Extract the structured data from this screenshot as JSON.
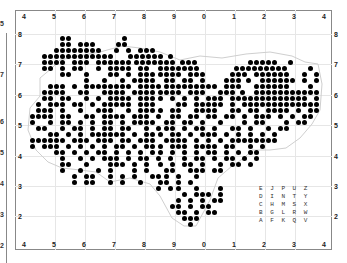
{
  "map": {
    "top_axis_labels": [
      "4",
      "5",
      "6",
      "7",
      "8",
      "9",
      "0",
      "1",
      "2",
      "3",
      "4"
    ],
    "bottom_axis_labels": [
      "4",
      "5",
      "6",
      "7",
      "8",
      "9",
      "0",
      "1",
      "2",
      "3",
      "4"
    ],
    "left_axis_labels": [
      "8",
      "7",
      "6",
      "5",
      "4",
      "3",
      "2"
    ],
    "right_axis_labels": [
      "8",
      "7",
      "6",
      "5",
      "4",
      "3",
      "2"
    ],
    "previous_panel_labels": [
      "5",
      "7",
      "6",
      "5",
      "4",
      "3",
      "2"
    ],
    "dot_color": "#000000",
    "grid_color": "#e6e6e6",
    "tetrad_legend": [
      [
        "E",
        "J",
        "P",
        "U",
        "Z"
      ],
      [
        "D",
        "I",
        "N",
        "T",
        "Y"
      ],
      [
        "C",
        "H",
        "M",
        "S",
        "X"
      ],
      [
        "B",
        "G",
        "L",
        "R",
        "W"
      ],
      [
        "A",
        "F",
        "K",
        "Q",
        "V"
      ]
    ],
    "dot_rows": [
      {
        "y": 38,
        "xs": [
          62,
          68,
          124
        ]
      },
      {
        "y": 44,
        "xs": [
          62,
          68,
          80,
          86,
          92,
          118,
          124
        ]
      },
      {
        "y": 50,
        "xs": [
          56,
          62,
          68,
          74,
          80,
          86,
          92,
          98,
          116,
          128,
          140,
          146,
          152
        ]
      },
      {
        "y": 56,
        "xs": [
          44,
          50,
          56,
          62,
          68,
          74,
          80,
          86,
          92,
          98,
          104,
          110,
          130,
          136,
          142,
          148,
          154,
          160,
          170
        ]
      },
      {
        "y": 62,
        "xs": [
          44,
          50,
          56,
          62,
          74,
          80,
          86,
          98,
          104,
          110,
          116,
          122,
          128,
          136,
          142,
          148,
          154,
          160,
          166,
          172,
          182,
          188,
          194,
          250,
          256,
          262,
          268,
          274,
          290
        ]
      },
      {
        "y": 68,
        "xs": [
          44,
          50,
          62,
          74,
          80,
          98,
          110,
          116,
          122,
          128,
          140,
          146,
          160,
          166,
          172,
          178,
          184,
          190,
          196,
          236,
          242,
          248,
          254,
          260,
          266,
          272,
          278,
          284,
          310
        ]
      },
      {
        "y": 74,
        "xs": [
          62,
          68,
          86,
          110,
          116,
          128,
          140,
          146,
          152,
          160,
          166,
          172,
          178,
          190,
          196,
          202,
          232,
          238,
          244,
          256,
          262,
          268,
          274,
          280,
          286,
          304,
          316
        ]
      },
      {
        "y": 80,
        "xs": [
          86,
          104,
          122,
          134,
          140,
          146,
          152,
          166,
          172,
          184,
          190,
          202,
          226,
          232,
          238,
          248,
          262,
          268,
          274,
          280,
          286,
          292,
          304,
          316
        ]
      },
      {
        "y": 86,
        "xs": [
          50,
          56,
          62,
          74,
          86,
          92,
          98,
          104,
          110,
          116,
          122,
          128,
          140,
          146,
          152,
          158,
          166,
          172,
          178,
          184,
          190,
          196,
          202,
          208,
          214,
          226,
          232,
          238,
          256,
          262,
          268,
          274,
          280,
          286,
          310
        ]
      },
      {
        "y": 92,
        "xs": [
          44,
          50,
          56,
          62,
          80,
          86,
          104,
          110,
          116,
          122,
          134,
          140,
          146,
          152,
          160,
          166,
          172,
          178,
          190,
          196,
          202,
          220,
          226,
          232,
          242,
          256,
          262,
          268,
          274,
          280,
          286,
          292,
          298,
          304,
          310,
          316
        ]
      },
      {
        "y": 98,
        "xs": [
          44,
          50,
          62,
          68,
          86,
          98,
          110,
          116,
          122,
          128,
          140,
          146,
          152,
          160,
          172,
          184,
          196,
          208,
          214,
          220,
          232,
          238,
          244,
          250,
          256,
          262,
          268,
          274,
          280,
          286,
          292,
          298,
          304,
          316
        ]
      },
      {
        "y": 104,
        "xs": [
          38,
          50,
          56,
          62,
          74,
          80,
          92,
          104,
          110,
          116,
          122,
          128,
          140,
          146,
          152,
          178,
          184,
          196,
          202,
          208,
          214,
          220,
          232,
          244,
          250,
          256,
          262,
          268,
          274,
          280,
          286,
          292,
          298,
          304,
          310,
          316
        ]
      },
      {
        "y": 110,
        "xs": [
          38,
          44,
          50,
          62,
          80,
          98,
          104,
          110,
          128,
          140,
          146,
          152,
          160,
          172,
          178,
          196,
          202,
          208,
          214,
          232,
          238,
          250,
          256,
          268,
          274,
          280,
          286,
          298,
          310,
          316
        ]
      },
      {
        "y": 116,
        "xs": [
          32,
          38,
          44,
          50,
          62,
          68,
          86,
          92,
          104,
          110,
          116,
          122,
          134,
          140,
          146,
          158,
          172,
          178,
          190,
          196,
          208,
          214,
          226,
          232,
          244,
          256,
          262,
          268,
          280,
          292,
          304,
          310
        ]
      },
      {
        "y": 122,
        "xs": [
          32,
          50,
          62,
          68,
          80,
          92,
          104,
          110,
          122,
          134,
          140,
          146,
          152,
          166,
          172,
          184,
          190,
          202,
          220,
          244,
          256,
          262,
          286,
          298,
          304
        ]
      },
      {
        "y": 128,
        "xs": [
          38,
          44,
          62,
          74,
          80,
          92,
          104,
          110,
          122,
          128,
          146,
          158,
          166,
          172,
          184,
          196,
          202,
          214,
          232,
          238,
          250,
          268,
          280,
          286
        ]
      },
      {
        "y": 134,
        "xs": [
          50,
          56,
          68,
          80,
          92,
          98,
          104,
          110,
          116,
          122,
          134,
          146,
          152,
          160,
          172,
          178,
          190,
          202,
          208,
          214,
          226,
          238,
          250,
          262,
          274
        ]
      },
      {
        "y": 140,
        "xs": [
          32,
          38,
          44,
          50,
          56,
          62,
          74,
          80,
          86,
          98,
          104,
          110,
          122,
          128,
          140,
          146,
          152,
          166,
          172,
          178,
          184,
          196,
          208,
          220,
          232,
          238,
          244,
          250,
          256,
          262,
          268,
          274
        ]
      },
      {
        "y": 146,
        "xs": [
          32,
          44,
          50,
          56,
          68,
          80,
          92,
          104,
          116,
          122,
          134,
          146,
          152,
          160,
          172,
          178,
          184,
          196,
          202,
          208,
          214,
          226,
          232,
          250,
          262
        ]
      },
      {
        "y": 152,
        "xs": [
          56,
          62,
          74,
          86,
          98,
          104,
          116,
          128,
          140,
          152,
          160,
          172,
          184,
          196,
          208,
          214,
          226,
          238,
          250,
          256
        ]
      },
      {
        "y": 158,
        "xs": [
          62,
          80,
          92,
          104,
          110,
          116,
          128,
          140,
          146,
          158,
          170,
          184,
          196,
          202,
          214,
          226,
          232,
          244,
          256
        ]
      },
      {
        "y": 164,
        "xs": [
          62,
          68,
          86,
          110,
          116,
          122,
          134,
          146,
          160,
          172,
          184,
          190,
          202,
          220,
          232,
          238,
          250
        ]
      },
      {
        "y": 170,
        "xs": [
          62,
          80,
          98,
          110,
          134,
          146,
          166,
          172,
          190,
          196,
          202,
          214,
          220
        ]
      },
      {
        "y": 176,
        "xs": [
          74,
          86,
          92,
          110,
          122,
          134,
          152,
          158,
          166,
          178,
          196
        ]
      },
      {
        "y": 182,
        "xs": [
          74,
          86,
          92,
          110,
          122,
          140,
          160,
          166,
          178,
          190
        ]
      },
      {
        "y": 188,
        "xs": [
          158,
          170,
          178,
          196,
          220
        ]
      },
      {
        "y": 194,
        "xs": [
          184,
          196,
          202,
          208,
          220
        ]
      },
      {
        "y": 200,
        "xs": [
          178,
          190,
          202,
          214,
          220
        ]
      },
      {
        "y": 206,
        "xs": [
          172,
          178,
          190,
          202,
          208
        ]
      },
      {
        "y": 212,
        "xs": [
          178,
          184,
          196,
          208,
          214
        ]
      },
      {
        "y": 218,
        "xs": [
          184,
          190,
          196
        ]
      },
      {
        "y": 224,
        "xs": [
          190
        ]
      }
    ]
  }
}
